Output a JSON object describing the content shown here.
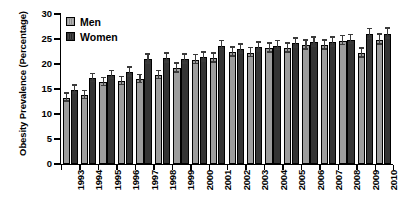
{
  "chart_data": {
    "type": "bar",
    "title": "",
    "subtitle": "",
    "xlabel": "",
    "ylabel": "Obesity Prevalence (Percentage)",
    "ylim": [
      0,
      30
    ],
    "yticks": [
      0,
      5,
      10,
      15,
      20,
      25,
      30
    ],
    "ytick_labels": [
      "0",
      "5",
      "10",
      "15",
      "20",
      "25",
      "30"
    ],
    "grid": false,
    "legend_position": "top-left",
    "categories": [
      "1993",
      "1994",
      "1995",
      "1996",
      "1997",
      "1998",
      "1999",
      "2000",
      "2001",
      "2002",
      "2003",
      "2004",
      "2005",
      "2006",
      "2007",
      "2008",
      "2009",
      "2010"
    ],
    "series": [
      {
        "name": "Men",
        "color": "#9d9d9d",
        "values": [
          13.3,
          13.8,
          16.4,
          16.6,
          17.0,
          17.8,
          19.2,
          20.9,
          21.2,
          22.4,
          22.3,
          23.2,
          23.2,
          23.8,
          23.8,
          24.7,
          22.2,
          24.9
        ],
        "err_low": [
          0.8,
          0.8,
          0.8,
          0.8,
          0.8,
          0.8,
          0.9,
          0.9,
          0.9,
          0.9,
          0.9,
          0.9,
          0.9,
          0.9,
          0.9,
          0.9,
          0.9,
          1.0
        ],
        "err_high": [
          0.8,
          0.8,
          0.8,
          0.8,
          0.8,
          0.8,
          0.9,
          0.9,
          0.9,
          0.9,
          0.9,
          0.9,
          0.9,
          0.9,
          0.9,
          0.9,
          0.9,
          1.0
        ]
      },
      {
        "name": "Women",
        "color": "#343434",
        "values": [
          14.9,
          17.2,
          17.8,
          18.4,
          21.0,
          21.2,
          21.0,
          21.4,
          23.7,
          23.0,
          23.4,
          23.7,
          24.2,
          24.4,
          24.4,
          24.9,
          26.0,
          26.1
        ],
        "err_low": [
          0.8,
          0.8,
          0.8,
          0.9,
          0.9,
          0.9,
          0.9,
          0.9,
          0.9,
          0.9,
          0.9,
          0.9,
          0.9,
          0.9,
          0.9,
          0.9,
          1.0,
          1.0
        ],
        "err_high": [
          0.8,
          0.8,
          0.8,
          0.9,
          0.9,
          0.9,
          0.9,
          0.9,
          0.9,
          0.9,
          0.9,
          0.9,
          0.9,
          0.9,
          0.9,
          0.9,
          1.0,
          1.0
        ]
      }
    ]
  },
  "legend": {
    "entries": [
      {
        "label": "Men"
      },
      {
        "label": "Women"
      }
    ]
  }
}
